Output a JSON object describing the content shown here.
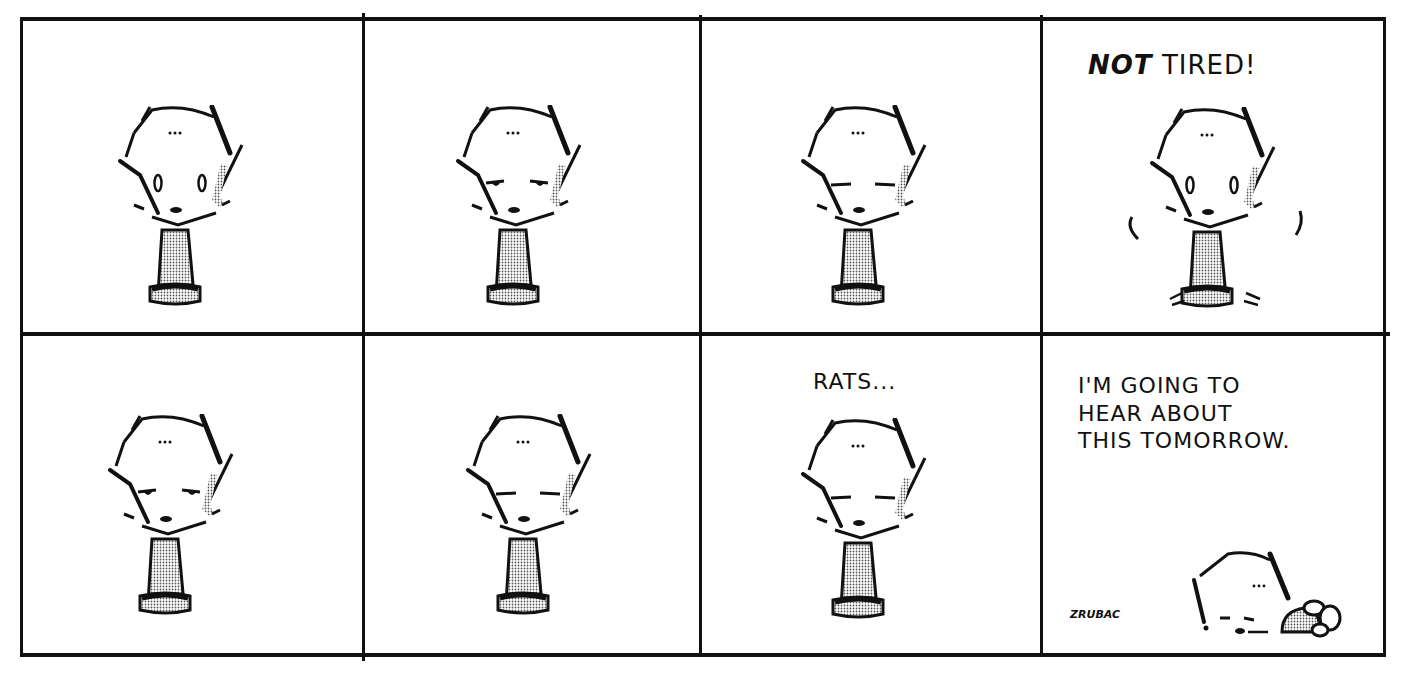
{
  "comic": {
    "layout": {
      "rows": 2,
      "columns": 4
    },
    "panels": [
      {
        "row": 1,
        "col": 1,
        "caption": "",
        "expression": "eyes-wide-open"
      },
      {
        "row": 1,
        "col": 2,
        "caption": "",
        "expression": "eyes-half-closed"
      },
      {
        "row": 1,
        "col": 3,
        "caption": "",
        "expression": "eyes-closed"
      },
      {
        "row": 1,
        "col": 4,
        "caption_bold": "NOT",
        "caption": "TIRED!",
        "expression": "eyes-wide-open-jolted"
      },
      {
        "row": 2,
        "col": 1,
        "caption": "",
        "expression": "eyes-half-closed"
      },
      {
        "row": 2,
        "col": 2,
        "caption": "",
        "expression": "eyes-closed"
      },
      {
        "row": 2,
        "col": 3,
        "caption": "RATS...",
        "expression": "eyes-closed"
      },
      {
        "row": 2,
        "col": 4,
        "caption_lines": [
          "I'M GOING TO",
          "HEAR ABOUT",
          "THIS TOMORROW."
        ],
        "expression": "asleep-face-down",
        "signature": "ZRUBAC"
      }
    ]
  }
}
